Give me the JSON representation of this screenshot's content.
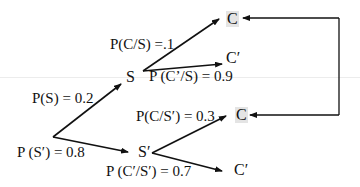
{
  "diagram": {
    "type": "probability-tree",
    "root_branches": [
      {
        "label": "P(S) = 0.2",
        "to": "S"
      },
      {
        "label": "P (S′) = 0.8",
        "to": "S′"
      }
    ],
    "nodes": {
      "S": "S",
      "S_prime": "S′",
      "C_top": "C",
      "C_prime_top": "C′",
      "C_mid": "C",
      "C_prime_bottom": "C′"
    },
    "edge_labels": {
      "p_c_given_s": "P(C/S) =.1",
      "p_cprime_given_s": "P (C’/S) = 0.9",
      "p_c_given_sprime": "P(C/S′) = 0.3",
      "p_cprime_given_sprime": "P (C′/S′) = 0.7",
      "p_s": "P(S) = 0.2",
      "p_sprime": "P (S′) = 0.8"
    },
    "connector": "bracket arrow linking both C outcomes",
    "colors": {
      "line": "#111111",
      "highlight": "#e4e4e4"
    }
  }
}
